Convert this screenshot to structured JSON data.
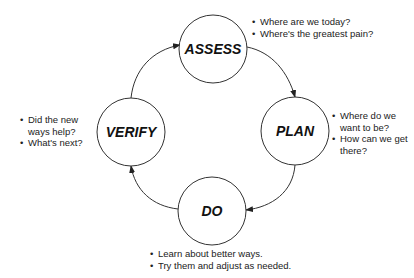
{
  "cycle": {
    "nodes": [
      {
        "id": "assess",
        "label": "ASSESS",
        "cx": 213,
        "cy": 49,
        "r": 34
      },
      {
        "id": "plan",
        "label": "PLAN",
        "cx": 295,
        "cy": 131,
        "r": 34
      },
      {
        "id": "do",
        "label": "DO",
        "cx": 212,
        "cy": 211,
        "r": 34
      },
      {
        "id": "verify",
        "label": "VERIFY",
        "cx": 131,
        "cy": 132,
        "r": 34
      }
    ],
    "direction": "clockwise",
    "stroke_color": "#333333"
  },
  "notes": {
    "assess": [
      "Where are we today?",
      "Where's the greatest pain?"
    ],
    "plan": [
      "Where do we want to be?",
      "How can we get there?"
    ],
    "do": [
      "Learn about better ways.",
      "Try them and adjust as needed."
    ],
    "verify": [
      "Did the new ways help?",
      "What's next?"
    ]
  }
}
